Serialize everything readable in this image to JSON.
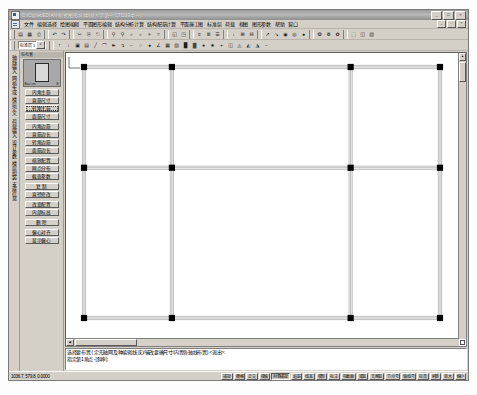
{
  "window": {
    "title": "D:\\CignedEDIAN-新式图形.pj  [中国大学第一 CTDS9中一]",
    "app_icon": "app-icon",
    "buttons": [
      {
        "name": "minimize",
        "glyph": "_"
      },
      {
        "name": "maximize",
        "glyph": "□"
      },
      {
        "name": "close",
        "glyph": "×"
      }
    ]
  },
  "menubar": {
    "doc_icon": "document-icon",
    "items": [
      "文件",
      "编辑选择",
      "绘图编辑",
      "平面图形编辑",
      "结构分析计算",
      "结构配筋计算",
      "平面施工图",
      "标准层",
      "荷载",
      "视图",
      "图形参数",
      "帮助",
      "窗口"
    ],
    "mdi_buttons": [
      {
        "name": "mdi-minimize",
        "glyph": "_"
      },
      {
        "name": "mdi-restore",
        "glyph": "□"
      },
      {
        "name": "mdi-close",
        "glyph": "×"
      }
    ]
  },
  "toolbar_main": {
    "groups": [
      [
        "▤",
        "▦",
        "⎙"
      ],
      [
        "↶",
        "↷"
      ],
      [
        "✂",
        "⎘",
        "⎋"
      ],
      [
        "⚲",
        "⚲",
        "⌕",
        "⌕",
        "⌖",
        "⌗"
      ],
      [
        "◱",
        "◳"
      ],
      [
        "≡",
        "≣",
        "☰"
      ],
      [
        "↓",
        "⊞",
        "⊟"
      ],
      [
        "↗",
        "↘",
        "◉",
        "◎",
        "●"
      ],
      [
        "❂",
        "❁",
        "✿"
      ],
      [
        "⬚",
        "◫",
        "▧"
      ]
    ]
  },
  "toolbar_draw": {
    "layer_combo": {
      "value": "标准层 1",
      "arrow": "▾"
    },
    "tools": [
      "↑",
      "↓",
      "▣",
      "▤",
      "╱",
      "⌒",
      "➽",
      "↴",
      "⌐",
      "○",
      "●",
      "∠",
      "▦",
      "▨",
      "█",
      "▓",
      "♠",
      "★",
      "+",
      "◫",
      "◬",
      "◭",
      "◮",
      "−"
    ]
  },
  "vertical_tabs": {
    "labels": [
      "轴线输入",
      "网格生成",
      "楼层定义",
      "荷载输入",
      "设计参数",
      "楼层组装",
      "支座信息"
    ]
  },
  "panel": {
    "caption": "柱布置",
    "preview": {
      "left_label": "Bx=/ cm",
      "right_label": "B"
    },
    "buttons": [
      {
        "label": "内角主筋",
        "selected": false
      },
      {
        "label": "直筋尺寸",
        "selected": false
      },
      {
        "label": "转角主筋",
        "selected": true
      },
      {
        "label": "面筋尺寸",
        "selected": false
      },
      {
        "label": "内角边筋",
        "selected": false
      },
      {
        "label": "直筋边长",
        "selected": false
      },
      {
        "label": "转角边筋",
        "selected": false
      },
      {
        "label": "面筋边长",
        "selected": false
      },
      {
        "label": "缩放配置",
        "selected": false
      },
      {
        "label": "网点分布",
        "selected": false
      },
      {
        "label": "截面参数",
        "selected": false
      },
      {
        "label": "复 制",
        "selected": false
      },
      {
        "label": "直径修改",
        "selected": false
      },
      {
        "label": "改变配置",
        "selected": false
      },
      {
        "label": "内部标高",
        "selected": false
      },
      {
        "label": "删 除",
        "selected": false
      },
      {
        "label": "偏心对齐",
        "selected": false
      },
      {
        "label": "显示偏心",
        "selected": false
      }
    ]
  },
  "chart_data": {
    "type": "scatter",
    "xlabel": "",
    "ylabel": "",
    "columns": [
      {
        "x": 0,
        "y": 0
      },
      {
        "x": 60,
        "y": 0
      },
      {
        "x": 182,
        "y": 0
      },
      {
        "x": 243,
        "y": 0
      },
      {
        "x": 0,
        "y": 55
      },
      {
        "x": 60,
        "y": 55
      },
      {
        "x": 182,
        "y": 55
      },
      {
        "x": 243,
        "y": 55
      },
      {
        "x": 0,
        "y": 137
      },
      {
        "x": 60,
        "y": 137
      },
      {
        "x": 182,
        "y": 137
      },
      {
        "x": 243,
        "y": 137
      }
    ],
    "beams": [
      {
        "x1": 0,
        "y1": 0,
        "x2": 243,
        "y2": 0
      },
      {
        "x1": 0,
        "y1": 55,
        "x2": 243,
        "y2": 55
      },
      {
        "x1": 0,
        "y1": 137,
        "x2": 243,
        "y2": 137
      },
      {
        "x1": 0,
        "y1": 0,
        "x2": 0,
        "y2": 137
      },
      {
        "x1": 60,
        "y1": 0,
        "x2": 60,
        "y2": 137
      },
      {
        "x1": 182,
        "y1": 0,
        "x2": 182,
        "y2": 137
      },
      {
        "x1": 243,
        "y1": 0,
        "x2": 243,
        "y2": 137
      }
    ],
    "grid": false,
    "legend": "none"
  },
  "canvas": {
    "ucs_label_x": "X",
    "ucs_label_y": "Y",
    "cursor_marker": "pick-box"
  },
  "command": {
    "lines": [
      "选择要布置 ( 定形轴网及种编辑线 或)/输改要确尺寸/内置各轴线布置) <退出>:",
      "指定第1角点 -[斜率]:"
    ]
  },
  "statusbar": {
    "coord": "1036.7, 579.8, 0.0000",
    "toggles": [
      {
        "label": "捕捉",
        "on": false
      },
      {
        "label": "栅格",
        "on": false
      },
      {
        "label": "正交",
        "on": false
      },
      {
        "label": "极轴",
        "on": false
      },
      {
        "label": "对象捕捉",
        "on": true
      },
      {
        "label": "追踪",
        "on": false
      },
      {
        "label": "线宽",
        "on": false
      },
      {
        "label": "模型",
        "on": false
      },
      {
        "label": "标注",
        "on": false
      },
      {
        "label": "柱截面",
        "on": false
      },
      {
        "label": "梁宽",
        "on": false
      },
      {
        "label": "支座宽",
        "on": false
      },
      {
        "label": "节点号",
        "on": false
      },
      {
        "label": "轴线号",
        "on": false
      },
      {
        "label": "标高",
        "on": false
      },
      {
        "label": "刷新",
        "on": false
      },
      {
        "label": "放大",
        "on": false
      },
      {
        "label": "缩小",
        "on": false
      }
    ]
  },
  "colors": {
    "chrome": "#d4d0c8",
    "title_bar": "#9a9a9a",
    "canvas_bg": "#ffffff",
    "column_fill": "#000000",
    "beam_line": "#8a8a8a"
  }
}
